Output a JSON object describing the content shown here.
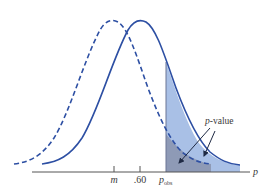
{
  "diagram": {
    "type": "sampling-distribution-p-value",
    "axis": {
      "variable_label": "p",
      "ticks": [
        {
          "label": "m",
          "italic": true
        },
        {
          "label": ".60",
          "italic": false
        },
        {
          "label_main": "p",
          "label_sub": "obs",
          "italic": true
        }
      ]
    },
    "curves": [
      {
        "name": "hypothesized-distribution",
        "style": "dashed",
        "center_label": "m"
      },
      {
        "name": "null-distribution",
        "style": "solid",
        "center_label": ".60"
      }
    ],
    "annotation": {
      "label_italic": "p",
      "label_rest": "-value"
    },
    "colors": {
      "curve": "#2d4fa3",
      "shade_light": "#a9c0e6",
      "shade_dark": "#8a93ad",
      "axis": "#555555",
      "text": "#3a3a3a"
    }
  }
}
